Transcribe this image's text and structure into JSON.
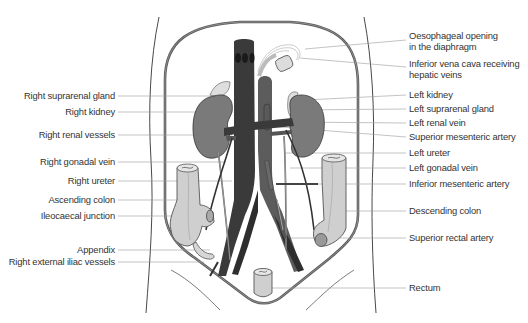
{
  "figure": {
    "colors": {
      "outline": "#555555",
      "vessel_dark": "#3a3a3a",
      "vessel_mid": "#5c5c5c",
      "kidney": "#7a7a7a",
      "gland": "#d8d8d8",
      "colon": "#cfcfcf",
      "leader_line": "#9a9a9a",
      "label_text": "#333333"
    }
  },
  "labels": {
    "left": [
      {
        "text": "Right suprarenal gland",
        "y": 96
      },
      {
        "text": "Right kidney",
        "y": 112
      },
      {
        "text": "Right renal vessels",
        "y": 135
      },
      {
        "text": "Right gonadal vein",
        "y": 162
      },
      {
        "text": "Right ureter",
        "y": 181
      },
      {
        "text": "Ascending colon",
        "y": 200
      },
      {
        "text": "Ileocaecal junction",
        "y": 216
      },
      {
        "text": "Appendix",
        "y": 250
      },
      {
        "text": "Right external iliac vessels",
        "y": 262
      }
    ],
    "right": [
      {
        "line1": "Oesophageal opening",
        "line2": "in the diaphragm",
        "y": 37
      },
      {
        "line1": "Inferior vena cava receiving",
        "line2": "hepatic veins",
        "y": 64
      },
      {
        "text": "Left kidney",
        "y": 95
      },
      {
        "text": "Left suprarenal gland",
        "y": 108
      },
      {
        "text": "Left renal vein",
        "y": 122
      },
      {
        "text": "Superior mesenteric artery",
        "y": 137
      },
      {
        "text": "Left ureter",
        "y": 153
      },
      {
        "text": "Left gonadal vein",
        "y": 168
      },
      {
        "text": "Inferior mesenteric artery",
        "y": 184
      },
      {
        "text": "Descending colon",
        "y": 211
      },
      {
        "text": "Superior rectal artery",
        "y": 238
      },
      {
        "text": "Rectum",
        "y": 288
      }
    ]
  }
}
